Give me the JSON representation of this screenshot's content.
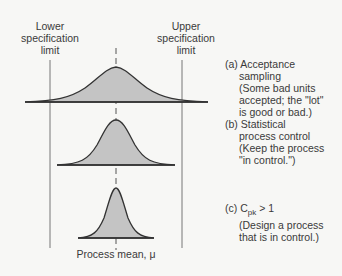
{
  "labels": {
    "lower_spec": [
      "Lower",
      "specification",
      "limit"
    ],
    "upper_spec": [
      "Upper",
      "specification",
      "limit"
    ],
    "process_mean": "Process mean, μ"
  },
  "notes": [
    {
      "id": "a",
      "prefix": "(a)",
      "lines": [
        "Acceptance",
        "sampling",
        "(Some bad units",
        "accepted; the \"lot\"",
        "is good or bad.)"
      ]
    },
    {
      "id": "b",
      "prefix": "(b)",
      "lines": [
        "Statistical",
        "process control",
        "(Keep the process",
        "\"in control.\")"
      ]
    },
    {
      "id": "c",
      "prefix": "(c)",
      "title_main": "C",
      "title_sub": "pk",
      "title_rest": " > 1",
      "lines": [
        "(Design a process",
        "that is in control.)"
      ]
    }
  ],
  "colors": {
    "fill": "#c4c4c4",
    "stroke": "#333333",
    "line": "#666666"
  }
}
